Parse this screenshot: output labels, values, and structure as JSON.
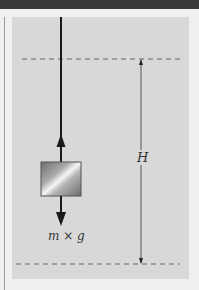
{
  "diagram": {
    "title": "",
    "labels": {
      "weight": "m × g",
      "height": "H"
    },
    "elements": {
      "rope": "vertical-rope",
      "block": "mass-block",
      "tension_arrow": "upward-arrow",
      "gravity_arrow": "downward-arrow",
      "top_reference": "dashed-line-top",
      "bottom_reference": "dashed-line-bottom",
      "dimension": "height-dimension-line"
    },
    "colors": {
      "topbar": "#3b3b3b",
      "background": "#f0f0ef",
      "panel": "#d8d8d8",
      "line": "#1a1a1a",
      "dashed": "#666666"
    }
  }
}
